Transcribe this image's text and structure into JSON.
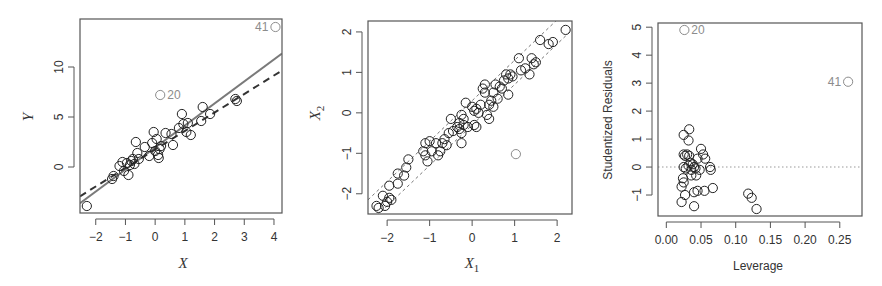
{
  "figure": {
    "panels": [
      "left-simple-regression",
      "middle-predictor-scatter",
      "right-leverage-plot"
    ]
  },
  "chart_data": [
    {
      "type": "scatter",
      "title": "",
      "xlabel": "X",
      "ylabel": "Y",
      "xlim": [
        -2.53,
        4.27
      ],
      "ylim": [
        -4.6,
        14.8
      ],
      "xticks": [
        -2,
        -1,
        0,
        1,
        2,
        3,
        4
      ],
      "yticks": [
        0,
        5,
        10
      ],
      "xtick_labels": [
        "−2",
        "−1",
        "0",
        "1",
        "2",
        "3",
        "4"
      ],
      "ytick_labels": [
        "0",
        "5",
        "10"
      ],
      "grid": false,
      "legend": null,
      "series": [
        {
          "name": "observations",
          "marker": "open-circle",
          "color": "#222222",
          "points": [
            [
              -2.3,
              -3.9
            ],
            [
              -1.45,
              -1.2
            ],
            [
              -1.4,
              -0.9
            ],
            [
              -1.2,
              0.1
            ],
            [
              -1.1,
              0.5
            ],
            [
              -1.05,
              -0.4
            ],
            [
              -0.95,
              0.4
            ],
            [
              -0.9,
              -0.8
            ],
            [
              -0.85,
              0.2
            ],
            [
              -0.8,
              0.6
            ],
            [
              -0.75,
              0.8
            ],
            [
              -0.7,
              0.3
            ],
            [
              -0.65,
              2.5
            ],
            [
              -0.6,
              1.4
            ],
            [
              -0.55,
              0.8
            ],
            [
              -0.35,
              2.0
            ],
            [
              -0.2,
              1.1
            ],
            [
              -0.1,
              2.4
            ],
            [
              -0.05,
              3.5
            ],
            [
              0.0,
              1.6
            ],
            [
              0.05,
              2.8
            ],
            [
              0.1,
              1.2
            ],
            [
              0.12,
              0.9
            ],
            [
              0.15,
              1.8
            ],
            [
              0.2,
              2.1
            ],
            [
              0.35,
              3.4
            ],
            [
              0.55,
              3.3
            ],
            [
              0.6,
              2.2
            ],
            [
              0.8,
              3.9
            ],
            [
              0.9,
              5.3
            ],
            [
              0.95,
              4.3
            ],
            [
              1.05,
              3.5
            ],
            [
              1.1,
              4.4
            ],
            [
              1.2,
              3.2
            ],
            [
              1.55,
              4.6
            ],
            [
              1.6,
              6.0
            ],
            [
              1.85,
              5.3
            ],
            [
              2.7,
              6.8
            ],
            [
              2.75,
              6.6
            ]
          ]
        },
        {
          "name": "highlighted",
          "marker": "open-circle",
          "color": "#8c8c8c",
          "points": [
            {
              "x": 0.17,
              "y": 7.2,
              "label": "20"
            },
            {
              "x": 4.05,
              "y": 14.0,
              "label": "41"
            }
          ]
        }
      ],
      "lines": [
        {
          "name": "fit-all-observations",
          "style": "solid",
          "color": "#7a7a7a",
          "intercept": 1.95,
          "slope": 2.2
        },
        {
          "name": "fit-without-41",
          "style": "dashed",
          "color": "#333333",
          "intercept": 1.75,
          "slope": 1.85
        }
      ]
    },
    {
      "type": "scatter",
      "title": "",
      "xlabel": "X1",
      "ylabel": "X2",
      "xlim": [
        -2.45,
        2.35
      ],
      "ylim": [
        -2.5,
        2.27
      ],
      "xticks": [
        -2,
        -1,
        0,
        1,
        2
      ],
      "yticks": [
        -2,
        -1,
        0,
        1,
        2
      ],
      "xtick_labels": [
        "−2",
        "−1",
        "0",
        "1",
        "2"
      ],
      "ytick_labels": [
        "−2",
        "−1",
        "0",
        "1",
        "2"
      ],
      "grid": false,
      "legend": null,
      "series": [
        {
          "name": "observations",
          "marker": "open-circle",
          "color": "#222222",
          "points": [
            [
              -2.25,
              -2.3
            ],
            [
              -2.2,
              -2.35
            ],
            [
              -2.1,
              -2.05
            ],
            [
              -2.05,
              -2.3
            ],
            [
              -2.0,
              -2.2
            ],
            [
              -1.95,
              -1.8
            ],
            [
              -1.95,
              -2.1
            ],
            [
              -1.9,
              -2.15
            ],
            [
              -1.75,
              -1.5
            ],
            [
              -1.75,
              -1.75
            ],
            [
              -1.6,
              -1.55
            ],
            [
              -1.55,
              -1.35
            ],
            [
              -1.5,
              -1.15
            ],
            [
              -1.15,
              -0.95
            ],
            [
              -1.1,
              -0.75
            ],
            [
              -1.1,
              -1.05
            ],
            [
              -1.05,
              -1.2
            ],
            [
              -1.0,
              -0.7
            ],
            [
              -0.95,
              -0.95
            ],
            [
              -0.85,
              -0.75
            ],
            [
              -0.8,
              -1.05
            ],
            [
              -0.75,
              -0.95
            ],
            [
              -0.7,
              -0.75
            ],
            [
              -0.65,
              -0.65
            ],
            [
              -0.6,
              -0.8
            ],
            [
              -0.55,
              -0.5
            ],
            [
              -0.5,
              -0.15
            ],
            [
              -0.45,
              -0.45
            ],
            [
              -0.35,
              -0.35
            ],
            [
              -0.3,
              -0.25
            ],
            [
              -0.3,
              -0.4
            ],
            [
              -0.25,
              -0.05
            ],
            [
              -0.25,
              -0.5
            ],
            [
              -0.2,
              -0.15
            ],
            [
              -0.2,
              -0.3
            ],
            [
              -0.25,
              -0.75
            ],
            [
              -0.15,
              0.25
            ],
            [
              -0.1,
              -0.35
            ],
            [
              0.0,
              0.15
            ],
            [
              0.05,
              0.05
            ],
            [
              0.05,
              -0.3
            ],
            [
              0.1,
              -0.35
            ],
            [
              0.1,
              0.1
            ],
            [
              0.15,
              0.0
            ],
            [
              0.2,
              0.2
            ],
            [
              0.25,
              0.6
            ],
            [
              0.3,
              0.5
            ],
            [
              0.3,
              0.7
            ],
            [
              0.35,
              -0.05
            ],
            [
              0.4,
              0.2
            ],
            [
              0.4,
              -0.15
            ],
            [
              0.45,
              0.3
            ],
            [
              0.5,
              0.5
            ],
            [
              0.5,
              0.15
            ],
            [
              0.55,
              0.7
            ],
            [
              0.6,
              0.35
            ],
            [
              0.65,
              0.65
            ],
            [
              0.7,
              0.6
            ],
            [
              0.75,
              0.8
            ],
            [
              0.8,
              0.95
            ],
            [
              0.85,
              0.85
            ],
            [
              0.85,
              0.45
            ],
            [
              0.9,
              0.95
            ],
            [
              0.95,
              0.9
            ],
            [
              1.1,
              1.35
            ],
            [
              1.15,
              1.05
            ],
            [
              1.25,
              1.1
            ],
            [
              1.35,
              0.95
            ],
            [
              1.4,
              1.35
            ],
            [
              1.45,
              1.2
            ],
            [
              1.5,
              1.25
            ],
            [
              1.6,
              1.8
            ],
            [
              1.8,
              1.7
            ],
            [
              1.9,
              1.75
            ],
            [
              2.2,
              2.05
            ]
          ]
        },
        {
          "name": "highlighted",
          "marker": "open-circle",
          "color": "#8c8c8c",
          "points": [
            {
              "x": 1.03,
              "y": -1.02,
              "label": ""
            }
          ]
        }
      ],
      "lines": [
        {
          "name": "upper-band",
          "style": "dotted",
          "color": "#777777",
          "intercept": 0.3,
          "slope": 1.0
        },
        {
          "name": "lower-band",
          "style": "dotted",
          "color": "#777777",
          "intercept": -0.3,
          "slope": 1.0
        }
      ]
    },
    {
      "type": "scatter",
      "title": "",
      "xlabel": "Leverage",
      "ylabel": "Studentized Residuals",
      "xlim": [
        -0.012,
        0.282
      ],
      "ylim": [
        -1.75,
        5.15
      ],
      "xticks": [
        0.0,
        0.05,
        0.1,
        0.15,
        0.2,
        0.25
      ],
      "yticks": [
        -1,
        0,
        1,
        2,
        3,
        4,
        5
      ],
      "xtick_labels": [
        "0.00",
        "0.05",
        "0.10",
        "0.15",
        "0.20",
        "0.25"
      ],
      "ytick_labels": [
        "−1",
        "0",
        "1",
        "2",
        "3",
        "4",
        "5"
      ],
      "grid": false,
      "legend": null,
      "series": [
        {
          "name": "observations",
          "marker": "open-circle",
          "color": "#222222",
          "points": [
            [
              0.025,
              1.15
            ],
            [
              0.033,
              1.35
            ],
            [
              0.032,
              0.95
            ],
            [
              0.025,
              0.45
            ],
            [
              0.027,
              0.4
            ],
            [
              0.03,
              0.45
            ],
            [
              0.033,
              0.4
            ],
            [
              0.025,
              0.0
            ],
            [
              0.028,
              -0.05
            ],
            [
              0.032,
              0.05
            ],
            [
              0.035,
              0.15
            ],
            [
              0.038,
              0.1
            ],
            [
              0.04,
              0.0
            ],
            [
              0.036,
              -0.1
            ],
            [
              0.042,
              -0.05
            ],
            [
              0.045,
              0.3
            ],
            [
              0.05,
              0.65
            ],
            [
              0.053,
              0.45
            ],
            [
              0.056,
              0.3
            ],
            [
              0.063,
              0.0
            ],
            [
              0.064,
              -0.1
            ],
            [
              0.048,
              -0.1
            ],
            [
              0.036,
              -0.3
            ],
            [
              0.043,
              -0.3
            ],
            [
              0.024,
              -0.4
            ],
            [
              0.025,
              -0.55
            ],
            [
              0.022,
              -0.7
            ],
            [
              0.027,
              -1.0
            ],
            [
              0.022,
              -1.25
            ],
            [
              0.04,
              -0.9
            ],
            [
              0.045,
              -0.85
            ],
            [
              0.055,
              -0.85
            ],
            [
              0.067,
              -0.75
            ],
            [
              0.04,
              -1.4
            ],
            [
              0.118,
              -0.95
            ],
            [
              0.123,
              -1.1
            ],
            [
              0.13,
              -1.5
            ]
          ]
        },
        {
          "name": "highlighted",
          "marker": "open-circle",
          "color": "#8c8c8c",
          "points": [
            {
              "x": 0.026,
              "y": 4.9,
              "label": "20"
            },
            {
              "x": 0.262,
              "y": 3.05,
              "label": "41"
            }
          ]
        }
      ],
      "reference_lines": [
        {
          "name": "zero-line",
          "orientation": "horizontal",
          "y": 0,
          "style": "dotted",
          "color": "#999999"
        }
      ]
    }
  ]
}
